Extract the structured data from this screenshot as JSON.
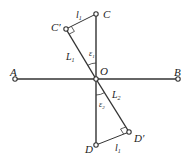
{
  "diagram": {
    "points": {
      "A": {
        "label": "A",
        "x": 15,
        "y": 79
      },
      "B": {
        "label": "B",
        "x": 178,
        "y": 79
      },
      "O": {
        "label": "O",
        "x": 96,
        "y": 79
      },
      "C": {
        "label": "C",
        "x": 96,
        "y": 14
      },
      "C_prime": {
        "label": "C′",
        "x": 66,
        "y": 29
      },
      "D": {
        "label": "D",
        "x": 96,
        "y": 145
      },
      "D_prime": {
        "label": "D′",
        "x": 129,
        "y": 132
      }
    },
    "segment_labels": {
      "l1_top": "l",
      "l1_top_sub": "1",
      "L1": "L",
      "L1_sub": "1",
      "L2": "L",
      "L2_sub": "2",
      "l1_bottom": "l",
      "l1_bottom_sub": "1"
    },
    "angle_labels": {
      "eps1": "ε",
      "eps1_sub": "1",
      "eps2": "ε",
      "eps2_sub": "2"
    },
    "colors": {
      "line": "#333333",
      "text": "#222222"
    }
  }
}
